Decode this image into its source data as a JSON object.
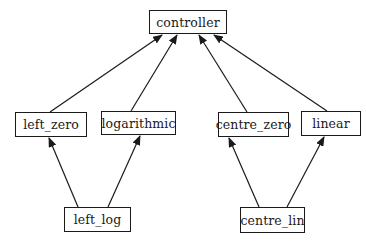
{
  "diagram": {
    "type": "class-hierarchy",
    "colors": {
      "line": "#1a1a1a",
      "background": "#ffffff",
      "text": "#1a1a1a"
    },
    "nodes": {
      "controller": {
        "label": "controller",
        "box": [
          149,
          10,
          78,
          24
        ]
      },
      "left_zero": {
        "label": "left_zero",
        "box": [
          15,
          112,
          72,
          25
        ]
      },
      "logarithmic": {
        "label": "logarithmic",
        "box": [
          101,
          111,
          75,
          24
        ]
      },
      "centre_zero": {
        "label": "centre_zero",
        "box": [
          218,
          112,
          71,
          25
        ]
      },
      "linear": {
        "label": "linear",
        "box": [
          301,
          111,
          60,
          25
        ]
      },
      "left_log": {
        "label": "left_log",
        "box": [
          64,
          207,
          67,
          25
        ]
      },
      "centre_lin": {
        "label": "centre_lin",
        "box": [
          240,
          207,
          65,
          26
        ]
      }
    },
    "edges": [
      {
        "from": "left_zero",
        "to": "controller",
        "x1": 50,
        "y1": 112,
        "x2": 162,
        "y2": 35
      },
      {
        "from": "logarithmic",
        "to": "controller",
        "x1": 131,
        "y1": 111,
        "x2": 177,
        "y2": 35
      },
      {
        "from": "centre_zero",
        "to": "controller",
        "x1": 247,
        "y1": 112,
        "x2": 199,
        "y2": 35
      },
      {
        "from": "linear",
        "to": "controller",
        "x1": 327,
        "y1": 111,
        "x2": 214,
        "y2": 35
      },
      {
        "from": "left_log",
        "to": "left_zero",
        "x1": 78,
        "y1": 207,
        "x2": 49,
        "y2": 138
      },
      {
        "from": "left_log",
        "to": "logarithmic",
        "x1": 108,
        "y1": 207,
        "x2": 140,
        "y2": 136
      },
      {
        "from": "centre_lin",
        "to": "centre_zero",
        "x1": 259,
        "y1": 207,
        "x2": 229,
        "y2": 138
      },
      {
        "from": "centre_lin",
        "to": "linear",
        "x1": 287,
        "y1": 207,
        "x2": 324,
        "y2": 137
      }
    ]
  }
}
